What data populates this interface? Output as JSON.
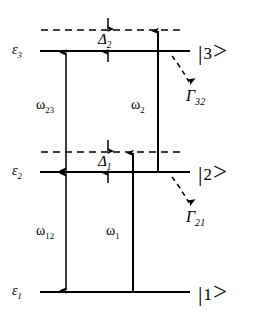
{
  "figure": {
    "type": "energy-level-diagram",
    "system": "three-level ladder",
    "background_color": "#ffffff",
    "line_color": "#000000"
  },
  "levels": [
    {
      "id": "level-3",
      "energy_label": "ε",
      "energy_subscript": "3",
      "ket_bar": "|",
      "ket_number": "3",
      "ket_gt": ">",
      "y": 51
    },
    {
      "id": "level-2",
      "energy_label": "ε",
      "energy_subscript": "2",
      "ket_bar": "|",
      "ket_number": "2",
      "ket_gt": ">",
      "y": 172
    },
    {
      "id": "level-1",
      "energy_label": "ε",
      "energy_subscript": "1",
      "ket_bar": "|",
      "ket_number": "1",
      "ket_gt": ">",
      "y": 292
    }
  ],
  "virtual_levels": [
    {
      "id": "virtual-upper",
      "y": 30
    },
    {
      "id": "virtual-lower",
      "y": 152
    }
  ],
  "detunings": [
    {
      "id": "detuning-2",
      "symbol": "Δ",
      "subscript": "2",
      "between": [
        "virtual-upper",
        "level-3"
      ]
    },
    {
      "id": "detuning-1",
      "symbol": "Δ",
      "subscript": "1",
      "between": [
        "virtual-lower",
        "level-2"
      ]
    }
  ],
  "transitions": [
    {
      "id": "omega-23",
      "symbol": "ω",
      "subscript": "23",
      "from": "level-2",
      "to": "level-3",
      "style": "double-headed"
    },
    {
      "id": "omega-12",
      "symbol": "ω",
      "subscript": "12",
      "from": "level-1",
      "to": "level-2",
      "style": "double-headed"
    },
    {
      "id": "omega-2",
      "symbol": "ω",
      "subscript": "2",
      "from": "level-2",
      "to": "virtual-upper",
      "style": "single-headed-up"
    },
    {
      "id": "omega-1",
      "symbol": "ω",
      "subscript": "1",
      "from": "level-1",
      "to": "virtual-lower",
      "style": "single-headed-up"
    }
  ],
  "decays": [
    {
      "id": "gamma-32",
      "symbol": "Γ",
      "subscript": "32",
      "from": "level-3",
      "style": "dashed-curved-arrow"
    },
    {
      "id": "gamma-21",
      "symbol": "Γ",
      "subscript": "21",
      "from": "level-2",
      "style": "dashed-curved-arrow"
    }
  ]
}
